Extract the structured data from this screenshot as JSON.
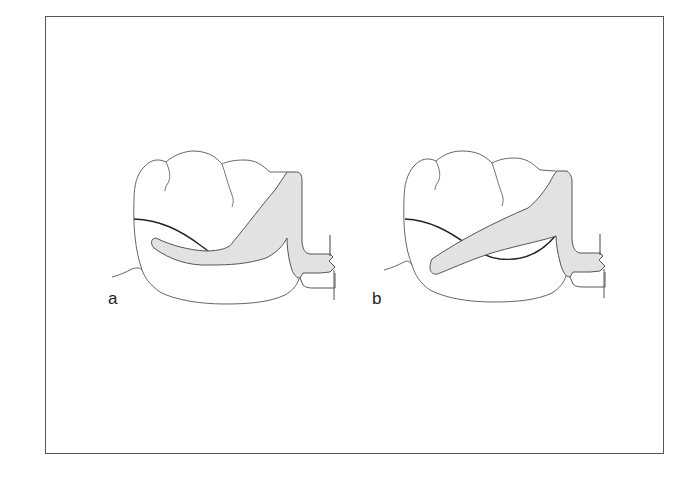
{
  "figure": {
    "panels": [
      {
        "id": "a",
        "label": "a",
        "description": "Molar with circumferential clasp arm curving along survey line"
      },
      {
        "id": "b",
        "label": "b",
        "description": "Molar with straight oblique clasp arm crossing survey line"
      }
    ],
    "colors": {
      "outline": "#555555",
      "survey_line": "#222222",
      "clasp_fill": "#e2e2e2",
      "frame": "#555555",
      "background": "#ffffff"
    }
  }
}
